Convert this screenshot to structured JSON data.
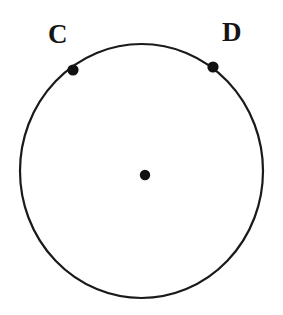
{
  "figure": {
    "kind": "geometry-diagram",
    "background_color": "#ffffff",
    "stroke_color": "#1a1a1a",
    "point_color": "#111111",
    "label_color": "#151515",
    "canvas": {
      "width": 283,
      "height": 315
    },
    "circle": {
      "name": "main-circle",
      "center_x": 141.5,
      "center_y": 171,
      "radius_x": 121.5,
      "radius_y": 127,
      "stroke_width": 2.2
    },
    "center_point": {
      "name": "circle-center-point",
      "x": 145,
      "y": 175,
      "radius": 5.2,
      "label": ""
    },
    "points": [
      {
        "name": "point-c",
        "label": "C",
        "x": 73,
        "y": 70,
        "radius": 5.6,
        "label_x": 48,
        "label_y": 21
      },
      {
        "name": "point-d",
        "label": "D",
        "x": 213,
        "y": 67,
        "radius": 5.6,
        "label_x": 222,
        "label_y": 19
      }
    ]
  },
  "chart_data": {
    "type": "scatter",
    "title": "",
    "xlabel": "",
    "ylabel": "",
    "annotations": [
      "C",
      "D"
    ],
    "categories": [
      "C",
      "D",
      "center"
    ],
    "values": [
      0,
      0,
      0
    ]
  }
}
